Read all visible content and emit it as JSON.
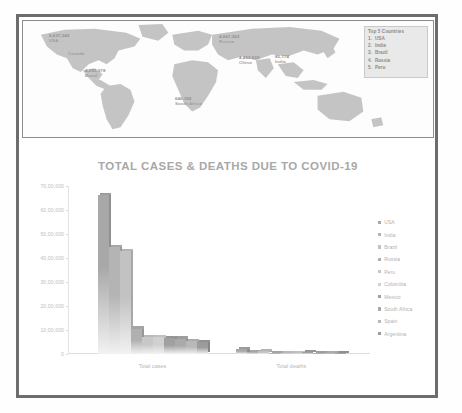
{
  "page": {
    "background_color": "#ffffff",
    "frame_color": "#6d6d6d"
  },
  "map_panel": {
    "name": "world-map-covid-cases",
    "border_color": "#8c8c8c",
    "land_color": "#bdbdbd",
    "land_color_light": "#cfcfcf",
    "labels": [
      {
        "value": "6,637,340",
        "name": "USA",
        "x": 10,
        "y": 10
      },
      {
        "value": "",
        "name": "Canada",
        "x": 30,
        "y": 28
      },
      {
        "value": "4,283,978",
        "name": "Brazil",
        "x": 48,
        "y": 47
      },
      {
        "value": "4,067,362",
        "name": "Russia",
        "x": 186,
        "y": 13
      },
      {
        "value": "4,462,639",
        "name": "China",
        "x": 228,
        "y": 34
      },
      {
        "value": "85,174",
        "name": "India",
        "x": 198,
        "y": 42
      },
      {
        "value": "646,395",
        "name": "South Africa",
        "x": 151,
        "y": 76
      }
    ],
    "top5": {
      "title": "Top 5 Countries",
      "items": [
        {
          "rank": "1.",
          "country": "USA"
        },
        {
          "rank": "2.",
          "country": "India"
        },
        {
          "rank": "3.",
          "country": "Brazil"
        },
        {
          "rank": "4.",
          "country": "Russia"
        },
        {
          "rank": "5.",
          "country": "Peru"
        }
      ]
    }
  },
  "chart_data": {
    "type": "bar",
    "title": "TOTAL CASES & DEATHS DUE TO COVID-19",
    "xlabel": "",
    "ylabel": "",
    "categories": [
      "Total cases",
      "Total deaths"
    ],
    "ylim": [
      0,
      7000000
    ],
    "yticks": [
      0,
      1000000,
      2000000,
      3000000,
      4000000,
      5000000,
      6000000,
      7000000
    ],
    "ytick_labels": [
      "0",
      "10,00,000",
      "20,00,000",
      "30,00,000",
      "40,00,000",
      "50,00,000",
      "60,00,000",
      "70,00,000"
    ],
    "grid": false,
    "legend_position": "right",
    "series": [
      {
        "name": "USA",
        "color": "#a8a8a8",
        "values": [
          6637340,
          197426
        ]
      },
      {
        "name": "India",
        "color": "#b4b4b4",
        "values": [
          4465863,
          75062
        ]
      },
      {
        "name": "Brazil",
        "color": "#c2c2c2",
        "values": [
          4283978,
          130474
        ]
      },
      {
        "name": "Russia",
        "color": "#b0b0b0",
        "values": [
          1057362,
          18484
        ]
      },
      {
        "name": "Peru",
        "color": "#c8c8c8",
        "values": [
          696190,
          30123
        ]
      },
      {
        "name": "Colombia",
        "color": "#d0d0d0",
        "values": [
          694664,
          22275
        ]
      },
      {
        "name": "Mexico",
        "color": "#a0a0a0",
        "values": [
          658299,
          70183
        ]
      },
      {
        "name": "South Africa",
        "color": "#aaaaaa",
        "values": [
          646398,
          15378
        ]
      },
      {
        "name": "Spain",
        "color": "#b8b8b8",
        "values": [
          525549,
          29628
        ]
      },
      {
        "name": "Argentina",
        "color": "#9c9c9c",
        "values": [
          500034,
          10405
        ]
      }
    ]
  }
}
